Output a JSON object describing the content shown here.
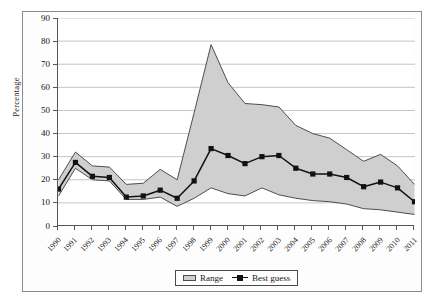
{
  "chart_data": {
    "type": "area",
    "title": "",
    "xlabel": "",
    "ylabel": "Percentage",
    "ylim": [
      0,
      90
    ],
    "ytick_step": 10,
    "yticks": [
      "0",
      "10",
      "20",
      "30",
      "40",
      "50",
      "60",
      "70",
      "80",
      "90"
    ],
    "grid": "horizontal",
    "legend_position": "bottom-center",
    "categories": [
      "1990",
      "1991",
      "1992",
      "1993",
      "1994",
      "1995",
      "1996",
      "1997",
      "1998",
      "1999",
      "2000",
      "2001",
      "2002",
      "2003",
      "2004",
      "2005",
      "2006",
      "2007",
      "2008",
      "2009",
      "2010",
      "2011"
    ],
    "series": [
      {
        "name": "Range",
        "kind": "band",
        "fill_color": "#cfcfcf",
        "edge_color": "#4d4d4d",
        "upper": [
          20,
          32,
          26,
          25.5,
          18,
          18.5,
          24.5,
          20,
          49,
          78.5,
          62,
          53,
          52.5,
          51.5,
          43.5,
          40,
          38,
          33,
          28,
          31,
          26,
          18
        ],
        "lower": [
          13,
          25,
          20,
          19.5,
          11.5,
          11.5,
          12.5,
          8.5,
          12,
          16.5,
          14,
          13,
          16.5,
          13.5,
          12,
          11,
          10.5,
          9.5,
          7.5,
          7,
          6,
          5
        ]
      },
      {
        "name": "Best guess",
        "kind": "line-marker",
        "line_color": "#111111",
        "marker": "square",
        "values": [
          16,
          27.5,
          21.5,
          21,
          12.5,
          13,
          15.5,
          12,
          19.5,
          33.5,
          30.5,
          27,
          30,
          30.5,
          25,
          22.5,
          22.5,
          21,
          17,
          19,
          16.5,
          10.5
        ]
      }
    ]
  },
  "legend": {
    "range_label": "Range",
    "best_guess_label": "Best guess"
  },
  "colors": {
    "band_fill": "#cfcfcf",
    "band_edge": "#4d4d4d",
    "line": "#111111",
    "grid": "#b5b5b5",
    "axis": "#55555a",
    "frame": "#8a8a8a"
  }
}
